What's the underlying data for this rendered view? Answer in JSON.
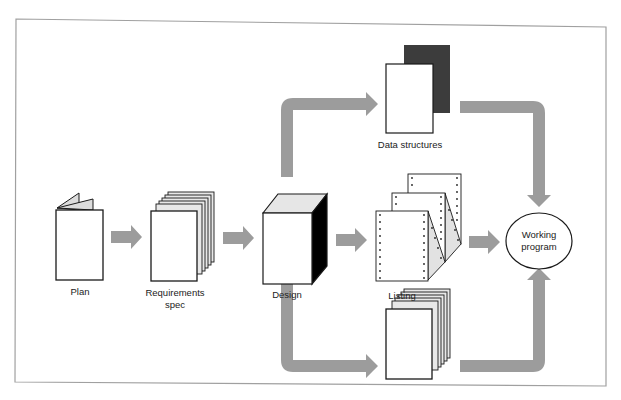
{
  "diagram": {
    "colors": {
      "background": "#ffffff",
      "frame": "#9a9a9a",
      "arrow": "#9c9c9c",
      "outline": "#1a1a1a",
      "page_fill": "#ffffff",
      "shade_light": "#dcdcdc",
      "shade_dark": "#3a3a3a",
      "cube_side": "#000000"
    },
    "nodes": [
      {
        "id": "plan",
        "label": "Plan",
        "icon": "booklet-icon"
      },
      {
        "id": "requirements",
        "label_line1": "Requirements",
        "label_line2": "spec",
        "icon": "document-stack-icon"
      },
      {
        "id": "design",
        "label": "Design",
        "icon": "cube-icon"
      },
      {
        "id": "data_structures",
        "label": "Data structures",
        "icon": "overlapping-pages-icon"
      },
      {
        "id": "listing",
        "label": "Listing",
        "icon": "fanfold-printout-icon"
      },
      {
        "id": "test_spec",
        "label": "Test spec",
        "icon": "document-stack-icon"
      },
      {
        "id": "working_program",
        "label_line1": "Working",
        "label_line2": "program",
        "icon": "ellipse"
      }
    ],
    "edges": [
      {
        "from": "plan",
        "to": "requirements"
      },
      {
        "from": "requirements",
        "to": "design"
      },
      {
        "from": "design",
        "to": "data_structures"
      },
      {
        "from": "design",
        "to": "listing"
      },
      {
        "from": "design",
        "to": "test_spec"
      },
      {
        "from": "data_structures",
        "to": "working_program"
      },
      {
        "from": "listing",
        "to": "working_program"
      },
      {
        "from": "test_spec",
        "to": "working_program"
      }
    ]
  }
}
